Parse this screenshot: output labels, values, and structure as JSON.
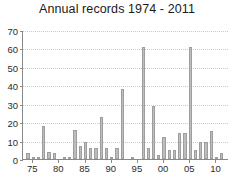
{
  "chart_data": {
    "type": "bar",
    "title": "Annual records 1974 - 2011",
    "xlabel": "",
    "ylabel": "",
    "ylim": [
      0,
      70
    ],
    "yticks": [
      0,
      10,
      20,
      30,
      40,
      50,
      60,
      70
    ],
    "xtick_labels": [
      "75",
      "80",
      "85",
      "90",
      "95",
      "00",
      "05",
      "10"
    ],
    "xtick_years": [
      1975,
      1980,
      1985,
      1990,
      1995,
      2000,
      2005,
      2010
    ],
    "grid": true,
    "legend": "none",
    "bar_color": "#bdbdbd",
    "bar_edge_color": "#9e9e9e",
    "axis_color": "#8a8a8a",
    "grid_color": "#c8c8c8",
    "categories": [
      1974,
      1975,
      1976,
      1977,
      1978,
      1979,
      1980,
      1981,
      1982,
      1983,
      1984,
      1985,
      1986,
      1987,
      1988,
      1989,
      1990,
      1991,
      1992,
      1993,
      1994,
      1995,
      1996,
      1997,
      1998,
      1999,
      2000,
      2001,
      2002,
      2003,
      2004,
      2005,
      2006,
      2007,
      2008,
      2009,
      2010,
      2011
    ],
    "values": [
      3,
      1,
      1,
      18,
      4,
      3,
      0,
      1,
      1,
      16,
      7,
      9,
      6,
      6,
      23,
      6,
      1,
      6,
      38,
      0,
      1,
      0,
      61,
      6,
      29,
      2,
      12,
      5,
      5,
      14,
      14,
      61,
      5,
      9,
      9,
      15,
      1,
      3
    ]
  }
}
